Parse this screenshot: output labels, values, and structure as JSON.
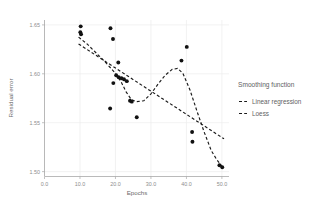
{
  "chart_data": {
    "type": "scatter",
    "title": "",
    "xlabel": "Epochs",
    "ylabel": "Residual error",
    "xlim": [
      0.0,
      52.0
    ],
    "ylim": [
      1.495,
      1.655
    ],
    "grid": true,
    "xticks": [
      "0.0",
      "10.0",
      "20.0",
      "30.0",
      "40.0",
      "50.0"
    ],
    "xtick_values": [
      0.0,
      10.0,
      20.0,
      30.0,
      40.0,
      50.0
    ],
    "yticks": [
      "1.65",
      "1.60",
      "1.55",
      "1.50"
    ],
    "ytick_values": [
      1.65,
      1.6,
      1.55,
      1.5
    ],
    "legend_position": "right",
    "marker_color": "#111111",
    "line_color": "#1a1a1a",
    "grid_color": "#ededed",
    "points": [
      {
        "x": 10.2,
        "y": 1.6485
      },
      {
        "x": 10.1,
        "y": 1.6425
      },
      {
        "x": 10.3,
        "y": 1.6405
      },
      {
        "x": 18.6,
        "y": 1.6465
      },
      {
        "x": 19.3,
        "y": 1.6355
      },
      {
        "x": 20.8,
        "y": 1.6115
      },
      {
        "x": 19.4,
        "y": 1.5905
      },
      {
        "x": 20.2,
        "y": 1.5985
      },
      {
        "x": 20.9,
        "y": 1.5965
      },
      {
        "x": 21.7,
        "y": 1.5955
      },
      {
        "x": 22.4,
        "y": 1.5945
      },
      {
        "x": 23.2,
        "y": 1.5925
      },
      {
        "x": 18.5,
        "y": 1.5645
      },
      {
        "x": 24.1,
        "y": 1.5725
      },
      {
        "x": 24.6,
        "y": 1.5715
      },
      {
        "x": 26.0,
        "y": 1.5555
      },
      {
        "x": 38.6,
        "y": 1.6135
      },
      {
        "x": 40.1,
        "y": 1.6275
      },
      {
        "x": 41.6,
        "y": 1.5405
      },
      {
        "x": 41.7,
        "y": 1.5305
      },
      {
        "x": 49.3,
        "y": 1.5065
      },
      {
        "x": 50.1,
        "y": 1.5045
      }
    ],
    "series": [
      {
        "name": "Linear regression",
        "type": "line",
        "style": "dashed",
        "x": [
          9.6,
          50.6
        ],
        "y": [
          1.6305,
          1.5335
        ]
      },
      {
        "name": "Loess",
        "type": "line",
        "style": "dashed",
        "x": [
          9.6,
          12.0,
          14.5,
          17.0,
          19.5,
          21.5,
          23.0,
          24.5,
          26.0,
          28.0,
          30.0,
          32.0,
          34.0,
          36.0,
          37.5,
          39.0,
          41.0,
          43.0,
          45.0,
          47.0,
          48.5,
          50.2
        ],
        "y": [
          1.6375,
          1.6305,
          1.6215,
          1.6125,
          1.6025,
          1.5925,
          1.5815,
          1.5735,
          1.5715,
          1.5725,
          1.5795,
          1.5895,
          1.5985,
          1.6045,
          1.6055,
          1.6005,
          1.5835,
          1.5615,
          1.5405,
          1.5215,
          1.5125,
          1.5045
        ]
      }
    ]
  },
  "legend": {
    "title": "Smoothing function",
    "items": [
      {
        "label": "Linear regression"
      },
      {
        "label": "Loess"
      }
    ]
  }
}
